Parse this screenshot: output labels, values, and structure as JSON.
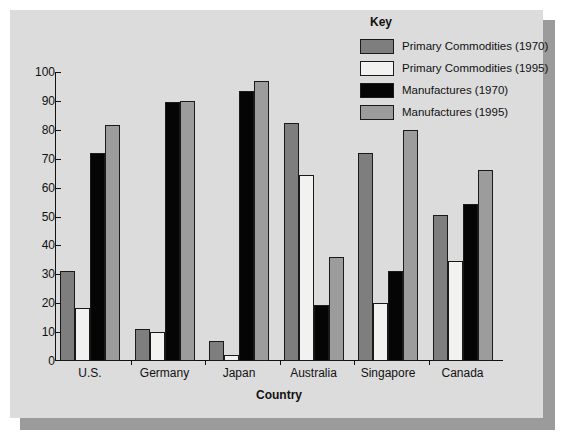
{
  "chart_data": {
    "type": "bar",
    "title": "",
    "xlabel": "Country",
    "ylabel": "",
    "ylim": [
      0,
      100
    ],
    "yticks": [
      0,
      10,
      20,
      30,
      40,
      50,
      60,
      70,
      80,
      90,
      100
    ],
    "grid": false,
    "legend_position": "top-right",
    "legend_title": "Key",
    "categories": [
      "U.S.",
      "Germany",
      "Japan",
      "Australia",
      "Singapore",
      "Canada"
    ],
    "series": [
      {
        "name": "Primary Commodities (1970)",
        "color": "#7e7e7e",
        "values": [
          31,
          11,
          7,
          82.5,
          72,
          50.5
        ]
      },
      {
        "name": "Primary Commodities (1995)",
        "color": "#f2f2f0",
        "values": [
          18.5,
          10,
          2,
          64.5,
          20,
          34.5
        ]
      },
      {
        "name": "Manufactures (1970)",
        "color": "#050505",
        "values": [
          72,
          89.5,
          93.5,
          19.5,
          31,
          54.5
        ]
      },
      {
        "name": "Manufactures (1995)",
        "color": "#9c9c9c",
        "values": [
          81.5,
          90,
          97,
          36,
          80,
          66
        ]
      }
    ]
  },
  "legend": {
    "title": "Key",
    "items": [
      {
        "label": "Primary Commodities (1970)",
        "swatch": "#7e7e7e"
      },
      {
        "label": "Primary Commodities (1995)",
        "swatch": "#f2f2f0"
      },
      {
        "label": "Manufactures (1970)",
        "swatch": "#050505"
      },
      {
        "label": "Manufactures (1995)",
        "swatch": "#9c9c9c"
      }
    ]
  },
  "axes": {
    "x_title": "Country",
    "y_tick_labels": [
      "100",
      "90",
      "80",
      "70",
      "60",
      "50",
      "40",
      "30",
      "20",
      "10",
      "0"
    ],
    "category_labels": [
      "U.S.",
      "Germany",
      "Japan",
      "Australia",
      "Singapore",
      "Canada"
    ]
  },
  "colors": {
    "panel_background": "#dcdcdc",
    "page_background": "#ffffff",
    "shadow": "#9b9b9b",
    "axis": "#111111"
  }
}
